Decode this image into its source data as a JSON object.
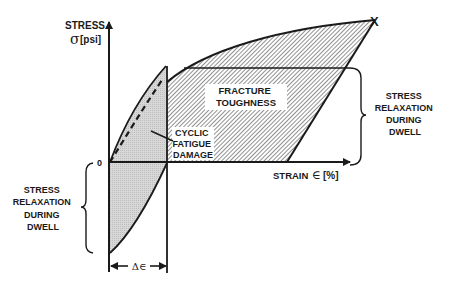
{
  "diagram": {
    "type": "stress-strain hysteresis diagram",
    "y_axis": {
      "title": "STRESS",
      "symbol": "σ",
      "unit": "[psi]"
    },
    "x_axis": {
      "title": "STRAIN",
      "symbol": "∈",
      "unit": "[%]"
    },
    "origin_label": "0",
    "fracture_mark": "X",
    "regions": {
      "fracture_toughness": [
        "FRACTURE",
        "TOUGHNESS"
      ],
      "cyclic_fatigue_damage": [
        "CYCLIC",
        "FATIGUE",
        "DAMAGE"
      ]
    },
    "brackets": {
      "right": [
        "STRESS",
        "RELAXATION",
        "DURING",
        "DWELL"
      ],
      "left": [
        "STRESS",
        "RELAXATION",
        "DURING",
        "DWELL"
      ]
    },
    "dimension": {
      "label": "Δ∈"
    },
    "colors": {
      "ink": "#1a1a1a",
      "cyclic_fill": "#d6d6d6",
      "hatch": "#555555"
    }
  }
}
